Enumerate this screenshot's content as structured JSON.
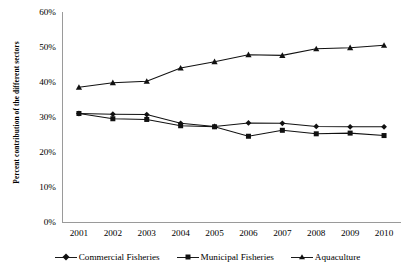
{
  "chart_data": {
    "type": "line",
    "title": "",
    "xlabel": "",
    "ylabel": "Percent contribution of the different sectors",
    "categories": [
      "2001",
      "2002",
      "2003",
      "2004",
      "2005",
      "2006",
      "2007",
      "2008",
      "2009",
      "2010"
    ],
    "ylim": [
      0,
      60
    ],
    "ytick_labels": [
      "0%",
      "10%",
      "20%",
      "30%",
      "40%",
      "50%",
      "60%"
    ],
    "ytick_values": [
      0,
      10,
      20,
      30,
      40,
      50,
      60
    ],
    "grid": false,
    "legend_position": "bottom",
    "series": [
      {
        "name": "Commercial Fisheries",
        "marker": "diamond",
        "color": "#111111",
        "values": [
          31.0,
          30.8,
          30.7,
          28.2,
          27.3,
          28.3,
          28.2,
          27.3,
          27.2,
          27.2
        ]
      },
      {
        "name": "Municipal Fisheries",
        "marker": "square",
        "color": "#111111",
        "values": [
          31.0,
          29.5,
          29.3,
          27.5,
          27.2,
          24.5,
          26.2,
          25.2,
          25.4,
          24.7
        ]
      },
      {
        "name": "Aquaculture",
        "marker": "triangle",
        "color": "#111111",
        "values": [
          38.5,
          39.8,
          40.2,
          44.0,
          45.8,
          47.8,
          47.6,
          49.5,
          49.8,
          50.5
        ]
      }
    ]
  },
  "axes": {
    "y_title": "Percent contribution of the different sectors"
  },
  "legend": {
    "items": [
      {
        "label": "Commercial Fisheries",
        "marker": "diamond"
      },
      {
        "label": "Municipal Fisheries",
        "marker": "square"
      },
      {
        "label": "Aquaculture",
        "marker": "triangle"
      }
    ]
  }
}
